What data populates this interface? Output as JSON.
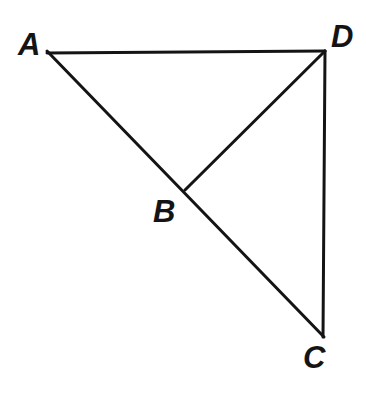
{
  "figure": {
    "type": "geometry-diagram",
    "width": 366,
    "height": 393,
    "background_color": "#ffffff",
    "stroke_color": "#141414",
    "stroke_width": 3,
    "points": [
      {
        "id": "A",
        "label": "A",
        "x": 47,
        "y": 51,
        "label_x": 18,
        "label_y": 29
      },
      {
        "id": "B",
        "label": "B",
        "x": 185,
        "y": 190,
        "label_x": 153,
        "label_y": 196
      },
      {
        "id": "C",
        "label": "C",
        "x": 324,
        "y": 337,
        "label_x": 303,
        "label_y": 342
      },
      {
        "id": "D",
        "label": "D",
        "x": 325,
        "y": 51,
        "label_x": 331,
        "label_y": 21
      }
    ],
    "segments": [
      {
        "id": "AD",
        "from": "A",
        "to": "D",
        "x1": 47,
        "y1": 53,
        "x2": 325,
        "y2": 51
      },
      {
        "id": "AC",
        "from": "A",
        "to": "C",
        "x1": 47,
        "y1": 51,
        "x2": 324,
        "y2": 337
      },
      {
        "id": "DC",
        "from": "D",
        "to": "C",
        "x1": 325,
        "y1": 51,
        "x2": 323,
        "y2": 337
      },
      {
        "id": "BD",
        "from": "B",
        "to": "D",
        "x1": 185,
        "y1": 190,
        "x2": 325,
        "y2": 51
      }
    ]
  }
}
